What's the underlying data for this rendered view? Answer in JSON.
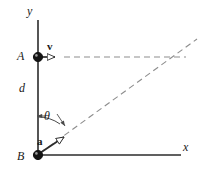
{
  "figure": {
    "type": "physics-kinematics-diagram",
    "width": 208,
    "height": 181,
    "background_color": "#ffffff",
    "stroke_color": "#2b2b2b",
    "dash_color": "#8a8a8a",
    "labels": {
      "y_axis": "y",
      "x_axis": "x",
      "point_a": "A",
      "point_b": "B",
      "distance": "d",
      "velocity_vector": "v",
      "acceleration_vector": "a",
      "angle": "θ"
    },
    "geometry": {
      "origin_b": [
        38,
        155
      ],
      "point_a": [
        38,
        57
      ],
      "y_axis": {
        "x": 38,
        "y_top": 20,
        "y_bottom": 155
      },
      "x_axis": {
        "y": 155,
        "x_left": 38,
        "x_right": 180
      },
      "velocity_arrow": {
        "from": [
          38,
          57
        ],
        "to": [
          63,
          57
        ],
        "direction": "right"
      },
      "dashed_horizontal": {
        "from": [
          63,
          57
        ],
        "to": [
          186,
          57
        ]
      },
      "dashed_diagonal": {
        "from": [
          38,
          155
        ],
        "to": [
          196,
          40
        ]
      },
      "acceleration_arrow": {
        "from": [
          40,
          153
        ],
        "to": [
          73,
          131
        ],
        "direction": "up-right"
      },
      "angle_arc": {
        "center": [
          38,
          155
        ],
        "radius": 38,
        "from_deg": 90,
        "to_deg": 54
      }
    }
  }
}
